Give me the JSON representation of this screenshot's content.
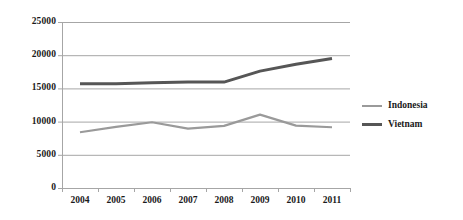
{
  "chart_data": {
    "type": "line",
    "title": "",
    "subtitle": "",
    "xlabel": "",
    "ylabel": "",
    "categories": [
      "2004",
      "2005",
      "2006",
      "2007",
      "2008",
      "2009",
      "2010",
      "2011"
    ],
    "series": [
      {
        "name": "Indonesia",
        "color": "#9a9a9a",
        "width": 2.2,
        "values": [
          8400,
          9200,
          9900,
          8950,
          9350,
          11050,
          9400,
          9150
        ]
      },
      {
        "name": "Vietnam",
        "color": "#565656",
        "width": 3.0,
        "values": [
          15700,
          15700,
          15850,
          15950,
          15950,
          17600,
          18650,
          19500
        ]
      }
    ],
    "ylim": [
      0,
      25000
    ],
    "yticks": [
      0,
      5000,
      10000,
      15000,
      20000,
      25000
    ],
    "ytick_labels": [
      "0",
      "5000",
      "10000",
      "15000",
      "20000",
      "25000"
    ],
    "grid": {
      "horizontal": true,
      "vertical": false,
      "color": "#a6a6a6"
    },
    "axis": {
      "color": "#a6a6a6",
      "y_axis_visible": true,
      "x_axis_visible": true,
      "tick_marks": true
    },
    "legend": {
      "position": "right",
      "entries": [
        "Indonesia",
        "Vietnam"
      ]
    }
  },
  "legend": {
    "items": [
      {
        "label": "Indonesia",
        "color": "#9a9a9a",
        "thickness": "2.5px"
      },
      {
        "label": "Vietnam",
        "color": "#565656",
        "thickness": "3.5px"
      }
    ]
  }
}
